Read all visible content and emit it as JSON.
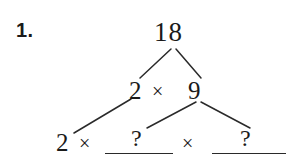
{
  "problem": {
    "number_label": "1.",
    "type": "factor-tree"
  },
  "tree": {
    "root": {
      "value": "18"
    },
    "middle": {
      "left_factor": "2",
      "operator": "×",
      "right_factor": "9"
    },
    "bottom": {
      "first_factor": "2",
      "operator_1": "×",
      "blank_1_marker": "?",
      "operator_2": "×",
      "blank_2_marker": "?"
    }
  },
  "style": {
    "ink_color": "#1a1a1a",
    "rule_color": "#2a2a2a",
    "background_color": "#ffffff"
  },
  "branches": {
    "root_to_left": {
      "x1": 171,
      "y1": 49,
      "x2": 140,
      "y2": 78
    },
    "root_to_right": {
      "x1": 176,
      "y1": 49,
      "x2": 201,
      "y2": 78
    },
    "left_to_bottom": {
      "x1": 131,
      "y1": 99,
      "x2": 74,
      "y2": 133
    },
    "right_to_blank1": {
      "x1": 196,
      "y1": 102,
      "x2": 147,
      "y2": 128
    },
    "right_to_blank2": {
      "x1": 201,
      "y1": 102,
      "x2": 250,
      "y2": 128
    }
  }
}
